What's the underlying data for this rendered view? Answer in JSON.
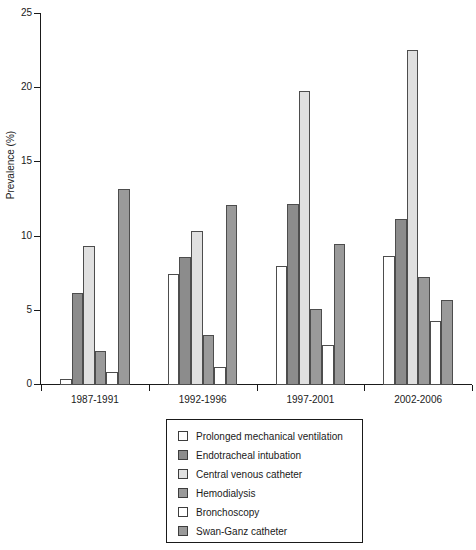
{
  "chart_data": {
    "type": "bar",
    "title": "",
    "xlabel": "",
    "ylabel": "Prevalence (%)",
    "ylim": [
      0,
      25
    ],
    "yticks": [
      0,
      5,
      10,
      15,
      20,
      25
    ],
    "ytick_labels": [
      "0",
      "5",
      "10",
      "15",
      "20",
      "25"
    ],
    "grid": false,
    "legend_position": "bottom-center",
    "categories": [
      "1987-1991",
      "1992-1996",
      "1997-2001",
      "2002-2006"
    ],
    "series": [
      {
        "name": "Prolonged mechanical ventilation",
        "color": "#ffffff",
        "values": [
          0.4,
          7.5,
          8.0,
          8.7
        ]
      },
      {
        "name": "Endotracheal intubation",
        "color": "#8c8c8c",
        "values": [
          6.2,
          8.6,
          12.2,
          11.2
        ]
      },
      {
        "name": "Central venous catheter",
        "color": "#e0e0e0",
        "values": [
          9.4,
          10.4,
          19.8,
          22.6
        ]
      },
      {
        "name": "Hemodialysis",
        "color": "#9a9a9a",
        "values": [
          2.3,
          3.4,
          5.1,
          7.3
        ]
      },
      {
        "name": "Bronchoscopy",
        "color": "#ffffff",
        "values": [
          0.9,
          1.2,
          2.7,
          4.3
        ]
      },
      {
        "name": "Swan-Ganz catheter",
        "color": "#9a9a9a",
        "values": [
          13.2,
          12.1,
          9.5,
          5.7
        ]
      }
    ]
  },
  "legend": {
    "items": [
      {
        "label": "Prolonged mechanical ventilation",
        "color": "#ffffff"
      },
      {
        "label": "Endotracheal intubation",
        "color": "#8c8c8c"
      },
      {
        "label": "Central venous catheter",
        "color": "#e0e0e0"
      },
      {
        "label": "Hemodialysis",
        "color": "#9a9a9a"
      },
      {
        "label": "Bronchoscopy",
        "color": "#ffffff"
      },
      {
        "label": "Swan-Ganz catheter",
        "color": "#9a9a9a"
      }
    ]
  },
  "style": {
    "axis_color": "#1a1a1a",
    "bar_border_color": "#4d4d4d",
    "background": "#ffffff"
  }
}
